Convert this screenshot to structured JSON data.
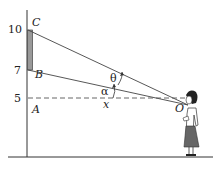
{
  "diagram": {
    "axis_ticks": [
      "10",
      "7",
      "5"
    ],
    "points": {
      "C": "C",
      "B": "B",
      "A": "A",
      "O": "O"
    },
    "angles": {
      "theta": "θ",
      "alpha": "α"
    },
    "distance": "x"
  }
}
